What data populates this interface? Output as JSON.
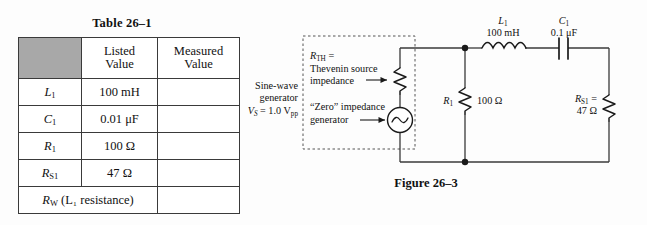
{
  "table": {
    "caption": "Table 26–1",
    "headers": [
      "",
      "Listed Value",
      "Measured Value"
    ],
    "header_lines": {
      "col1_line1": "Listed",
      "col1_line2": "Value",
      "col2_line1": "Measured",
      "col2_line2": "Value"
    },
    "rows": [
      {
        "symbol": "L",
        "symbol_sub": "1",
        "listed_value": "100 mH",
        "measured_value": ""
      },
      {
        "symbol": "C",
        "symbol_sub": "1",
        "listed_value": "0.01 μF",
        "measured_value": ""
      },
      {
        "symbol": "R",
        "symbol_sub": "1",
        "listed_value": "100 Ω",
        "measured_value": ""
      },
      {
        "symbol": "R",
        "symbol_sub": "S1",
        "listed_value": "47 Ω",
        "measured_value": ""
      }
    ],
    "last_row": {
      "symbol": "R",
      "symbol_sub": "W",
      "text": " (L₁ resistance)",
      "text_plain": "R_W (L_1 resistance)",
      "measured_value": ""
    }
  },
  "figure": {
    "caption": "Figure 26–3",
    "generator": {
      "line1": "Sine-wave",
      "line2": "generator",
      "line3_symbol": "V",
      "line3_sub": "S",
      "line3_value": " = 1.0 V",
      "line3_unit_sub": "pp"
    },
    "thevenin": {
      "label_symbol": "R",
      "label_sub": "TH",
      "label_eq": " =",
      "line2": "Thevenin source",
      "line3": "impedance"
    },
    "zero_impedance": {
      "line1": "“Zero” impedance",
      "line2": "generator"
    },
    "components": {
      "inductor": {
        "name": "L",
        "sub": "1",
        "value": "100 mH",
        "icon": "inductor-icon"
      },
      "capacitor": {
        "name": "C",
        "sub": "1",
        "value": "0.1 μF",
        "icon": "capacitor-icon"
      },
      "resistor_r1": {
        "name": "R",
        "sub": "1",
        "value": "100 Ω",
        "icon": "resistor-icon"
      },
      "resistor_rs1": {
        "name": "R",
        "sub": "S1",
        "eq": " =",
        "value": "47 Ω",
        "icon": "resistor-icon"
      },
      "source": {
        "icon": "ac-source-icon"
      },
      "thevenin_resistor": {
        "icon": "resistor-icon"
      }
    }
  },
  "colors": {
    "ink": "#111111",
    "wire": "#3a3a3a",
    "shade": "#a8a8a8",
    "background": "#fdfdfd",
    "dashed_box": "#555555"
  }
}
